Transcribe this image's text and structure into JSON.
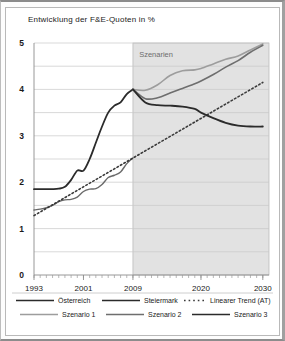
{
  "chart_data": {
    "type": "line",
    "title": "Entwicklung der F&E-Quoten in %",
    "xlabel": "",
    "ylabel": "",
    "ylim": [
      0,
      5
    ],
    "xlim": [
      1993,
      2031
    ],
    "yticks": [
      "0",
      "1",
      "2",
      "3",
      "4",
      "5"
    ],
    "ytick_values": [
      0,
      1,
      2,
      3,
      4,
      5
    ],
    "minor_gridlines": [
      0.5,
      1.5,
      2.5,
      3.5,
      4.5
    ],
    "xticks": [
      "1993",
      "2001",
      "2009",
      "2020",
      "2030"
    ],
    "xtick_values": [
      1993,
      2001,
      2009,
      2020,
      2030
    ],
    "grid": "horizontal",
    "legend_position": "bottom",
    "annotations": [
      {
        "text": "Szenarien",
        "x": 2010,
        "y": 4.7
      }
    ],
    "shaded_region": {
      "label": "Szenarien",
      "x_from": 2009,
      "x_to": 2031,
      "color": "#e2e2e2"
    },
    "series": [
      {
        "name": "Österreich",
        "color": "#2b2b2b",
        "style": "solid",
        "width": 1.8,
        "x": [
          1993,
          1994,
          1995,
          1996,
          1997,
          1998,
          1999,
          2000,
          2001,
          2002,
          2003,
          2004,
          2005,
          2006,
          2007,
          2008,
          2009
        ],
        "values": [
          1.85,
          1.85,
          1.85,
          1.85,
          1.86,
          1.9,
          2.05,
          2.25,
          2.25,
          2.5,
          2.85,
          3.2,
          3.5,
          3.65,
          3.72,
          3.9,
          4.0
        ]
      },
      {
        "name": "Steiermark",
        "color": "#6a6a6a",
        "style": "solid",
        "width": 1.4,
        "x": [
          1993,
          1994,
          1995,
          1996,
          1997,
          1998,
          1999,
          2000,
          2001,
          2002,
          2003,
          2004,
          2005,
          2006,
          2007,
          2008,
          2009
        ],
        "values": [
          1.4,
          1.42,
          1.45,
          1.5,
          1.58,
          1.62,
          1.63,
          1.68,
          1.8,
          1.85,
          1.86,
          1.95,
          2.1,
          2.15,
          2.22,
          2.4,
          2.52
        ]
      },
      {
        "name": "Linearer Trend (AT)",
        "color": "#3a3a3a",
        "style": "dotted",
        "width": 1.6,
        "x": [
          1993,
          2030
        ],
        "values": [
          1.28,
          4.15
        ]
      },
      {
        "name": "Szenario 1",
        "color": "#9d9d9d",
        "style": "solid",
        "width": 1.6,
        "x": [
          2009,
          2011,
          2013,
          2015,
          2017,
          2019,
          2020,
          2022,
          2024,
          2026,
          2028,
          2030
        ],
        "values": [
          4.0,
          3.98,
          4.1,
          4.3,
          4.4,
          4.42,
          4.45,
          4.55,
          4.65,
          4.72,
          4.85,
          4.98
        ]
      },
      {
        "name": "Szenario 2",
        "color": "#6e6e6e",
        "style": "solid",
        "width": 1.6,
        "x": [
          2009,
          2011,
          2013,
          2015,
          2017,
          2019,
          2020,
          2022,
          2024,
          2026,
          2028,
          2030
        ],
        "values": [
          4.0,
          3.8,
          3.82,
          3.92,
          4.02,
          4.12,
          4.18,
          4.32,
          4.48,
          4.62,
          4.8,
          4.95
        ]
      },
      {
        "name": "Szenario 3",
        "color": "#2b2b2b",
        "style": "solid",
        "width": 1.8,
        "x": [
          2009,
          2011,
          2013,
          2015,
          2017,
          2019,
          2020,
          2022,
          2024,
          2026,
          2028,
          2030
        ],
        "values": [
          4.0,
          3.72,
          3.66,
          3.65,
          3.63,
          3.58,
          3.5,
          3.38,
          3.28,
          3.22,
          3.2,
          3.2
        ]
      }
    ]
  },
  "legend": {
    "row1": [
      {
        "label": "Österreich",
        "color": "#2b2b2b",
        "style": "solid"
      },
      {
        "label": "Steiermark",
        "color": "#2b2b2b",
        "style": "solid"
      },
      {
        "label": "Linearer Trend (AT)",
        "color": "#3a3a3a",
        "style": "dotted"
      }
    ],
    "row2": [
      {
        "label": "Szenario 1",
        "color": "#9d9d9d",
        "style": "solid"
      },
      {
        "label": "Szenario 2",
        "color": "#6e6e6e",
        "style": "solid"
      },
      {
        "label": "Szenario 3",
        "color": "#2b2b2b",
        "style": "solid"
      }
    ]
  }
}
